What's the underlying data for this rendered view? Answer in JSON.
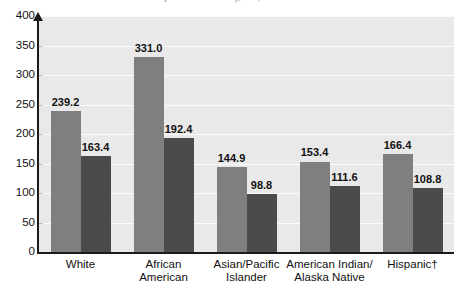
{
  "chart_data": {
    "type": "bar",
    "title": "by Race and Ethnicity, U.S., 1990-2000",
    "subtitle": "",
    "xlabel": "",
    "ylabel": "",
    "ylim": [
      0,
      400
    ],
    "yticks": [
      0,
      50,
      100,
      150,
      200,
      250,
      300,
      350,
      400
    ],
    "ytick_labels": [
      "0",
      "50",
      "100",
      "150",
      "200",
      "250",
      "300",
      "350",
      "400"
    ],
    "grid": true,
    "legend_position": "none",
    "categories": [
      "White",
      "African\nAmerican",
      "Asian/Pacific\nIslander",
      "American Indian/\nAlaska Native",
      "Hispanic†"
    ],
    "series": [
      {
        "name": "series-1",
        "color": "#7f7f7f",
        "values": [
          239.2,
          331.0,
          144.9,
          153.4,
          166.4
        ],
        "labels": [
          "239.2",
          "331.0",
          "144.9",
          "153.4",
          "166.4"
        ]
      },
      {
        "name": "series-2",
        "color": "#4b4b4b",
        "values": [
          163.4,
          192.4,
          98.8,
          111.6,
          108.8
        ],
        "labels": [
          "163.4",
          "192.4",
          "98.8",
          "111.6",
          "108.8"
        ]
      }
    ],
    "plot_background": "#e9e9e9",
    "gridline_color": "#fbfbfb",
    "axis_color": "#1a1a1a"
  }
}
